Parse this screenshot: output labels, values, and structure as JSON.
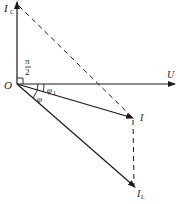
{
  "diagram": {
    "type": "phasor-diagram",
    "origin_label": "O",
    "phasors": [
      {
        "id": "U",
        "label": "U",
        "subscript": "",
        "direction": "horizontal-right",
        "style": "solid"
      },
      {
        "id": "IC",
        "label": "I",
        "subscript": "C",
        "direction": "vertical-up",
        "style": "solid"
      },
      {
        "id": "I",
        "label": "I",
        "subscript": "",
        "direction": "down-right",
        "style": "solid"
      },
      {
        "id": "IL",
        "label": "I",
        "subscript": "L",
        "direction": "down-right-steep",
        "style": "solid"
      }
    ],
    "construction_lines": [
      {
        "from": "IC",
        "to": "I",
        "style": "dashed"
      },
      {
        "from": "I",
        "to": "IL",
        "style": "dashed"
      }
    ],
    "angles": [
      {
        "label_num": "π",
        "label_den": "2",
        "between": [
          "U",
          "IC"
        ],
        "marker": "right-angle"
      },
      {
        "label": "φ",
        "subscript": "1",
        "between": [
          "U",
          "I"
        ]
      },
      {
        "label": "φ",
        "subscript": "",
        "between": [
          "U",
          "IL"
        ]
      }
    ]
  },
  "colors": {
    "stroke": "#1a1a1a",
    "background": "#ffffff"
  }
}
